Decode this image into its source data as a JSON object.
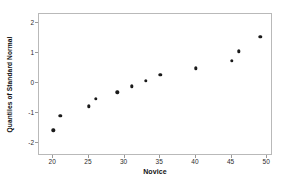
{
  "chart_data": {
    "type": "scatter",
    "title": "",
    "xlabel": "Novice",
    "ylabel": "Quantiles of Standard Normal",
    "xlim": [
      18.0,
      50.8
    ],
    "ylim": [
      -2.45,
      2.3
    ],
    "grid": false,
    "legend": null,
    "xticks": [
      20,
      25,
      30,
      35,
      40,
      45,
      50
    ],
    "xtick_labels": [
      "20",
      "25",
      "30",
      "35",
      "40",
      "45",
      "50"
    ],
    "yticks": [
      -2,
      -1,
      0,
      1,
      2
    ],
    "ytick_labels": [
      "-2",
      "-1",
      "0",
      "1",
      "2"
    ],
    "marker": "filled-circle",
    "marker_color": "#1a1a1a",
    "x": [
      20,
      21,
      25,
      26,
      29,
      31,
      33,
      35,
      40,
      45,
      46,
      49
    ],
    "y": [
      -1.59,
      -1.11,
      -0.79,
      -0.54,
      -0.32,
      -0.12,
      0.07,
      0.27,
      0.49,
      0.73,
      1.05,
      1.53
    ],
    "points": [
      {
        "x": 20,
        "y": -1.59
      },
      {
        "x": 21,
        "y": -1.11
      },
      {
        "x": 25,
        "y": -0.79
      },
      {
        "x": 26,
        "y": -0.54
      },
      {
        "x": 29,
        "y": -0.32
      },
      {
        "x": 31,
        "y": -0.12
      },
      {
        "x": 33,
        "y": 0.07
      },
      {
        "x": 35,
        "y": 0.27
      },
      {
        "x": 40,
        "y": 0.49
      },
      {
        "x": 45,
        "y": 0.73
      },
      {
        "x": 46,
        "y": 1.05
      },
      {
        "x": 49,
        "y": 1.53
      }
    ]
  }
}
